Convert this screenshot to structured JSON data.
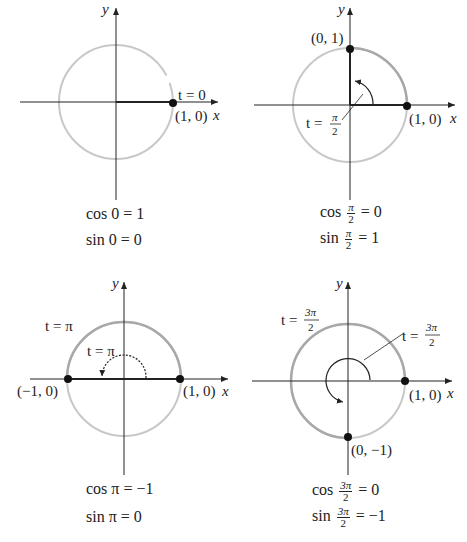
{
  "colors": {
    "axis": "#222222",
    "circle_light": "#c8c8c8",
    "circle_dark": "#a8a8a8",
    "point": "#111111",
    "text": "#222222"
  },
  "panels": [
    {
      "id": "t0",
      "axis_x_label": "x",
      "axis_y_label": "y",
      "t_label": "t = 0",
      "points": [
        {
          "label": "(1, 0)"
        }
      ],
      "cos_caption": "cos 0 = 1",
      "sin_caption": "sin 0 = 0"
    },
    {
      "id": "t_pi_over_2",
      "axis_x_label": "x",
      "axis_y_label": "y",
      "t_label_prefix": "t =",
      "t_label_num": "π",
      "t_label_den": "2",
      "points": [
        {
          "label": "(0, 1)"
        },
        {
          "label": "(1, 0)"
        }
      ],
      "cos_prefix": "cos",
      "cos_num": "π",
      "cos_den": "2",
      "cos_value": "= 0",
      "sin_prefix": "sin",
      "sin_num": "π",
      "sin_den": "2",
      "sin_value": "= 1"
    },
    {
      "id": "t_pi",
      "axis_x_label": "x",
      "axis_y_label": "y",
      "t_label_outer": "t = π",
      "t_label_inner": "t = π",
      "points": [
        {
          "label": "(−1, 0)"
        },
        {
          "label": "(1, 0)"
        }
      ],
      "cos_caption": "cos π = −1",
      "sin_caption": "sin π = 0"
    },
    {
      "id": "t_3pi_over_2",
      "axis_x_label": "x",
      "axis_y_label": "y",
      "t_label_prefix": "t =",
      "t_label_num": "3π",
      "t_label_den": "2",
      "points": [
        {
          "label": "(1, 0)"
        },
        {
          "label": "(0, −1)"
        }
      ],
      "cos_prefix": "cos",
      "cos_num": "3π",
      "cos_den": "2",
      "cos_value": "= 0",
      "sin_prefix": "sin",
      "sin_num": "3π",
      "sin_den": "2",
      "sin_value": "= −1"
    }
  ]
}
